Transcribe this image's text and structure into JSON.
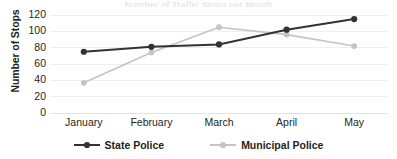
{
  "chart_data": {
    "type": "line",
    "title": "Number of Traffic Stops per Month",
    "xlabel": "",
    "ylabel": "Number of Stops",
    "categories": [
      "January",
      "February",
      "March",
      "April",
      "May"
    ],
    "yticks": [
      0,
      20,
      40,
      60,
      80,
      100,
      120
    ],
    "ylim": [
      0,
      120
    ],
    "grid": true,
    "legend_position": "bottom",
    "series": [
      {
        "name": "State Police",
        "color": "#333333",
        "marker": "circle-filled",
        "values": [
          75,
          81,
          84,
          102,
          115
        ]
      },
      {
        "name": "Municipal Police",
        "color": "#c4c4c4",
        "marker": "circle-filled",
        "values": [
          37,
          74,
          105,
          96,
          82
        ]
      }
    ]
  }
}
